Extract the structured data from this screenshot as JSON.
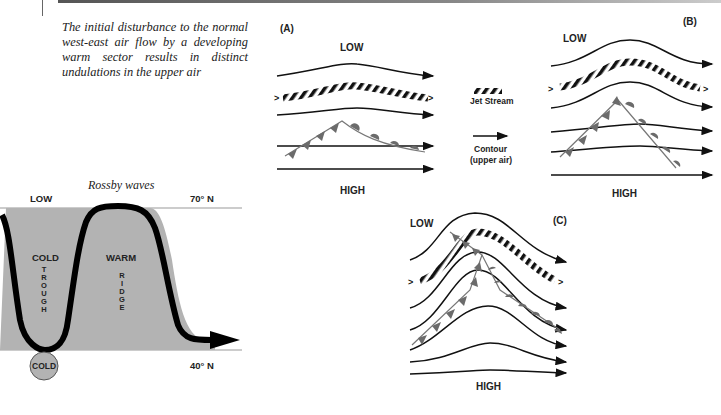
{
  "page": {
    "page_number": "90",
    "caption": "The initial disturbance to the normal west-east air flow by a developing warm sector results in distinct undulations in the upper air"
  },
  "rossby": {
    "title": "Rossby waves",
    "top_label": "LOW",
    "lat_top": "70° N",
    "lat_bottom": "40° N",
    "trough_temp": "COLD",
    "trough_letters": [
      "T",
      "R",
      "O",
      "U",
      "G",
      "H"
    ],
    "ridge_temp": "WARM",
    "ridge_letters": [
      "R",
      "I",
      "D",
      "G",
      "E"
    ],
    "cold_pool": "COLD",
    "colors": {
      "fill": "#b3b3b3",
      "curve": "#000000"
    }
  },
  "panels": {
    "a": {
      "tag": "(A)",
      "low": "LOW",
      "high": "HIGH"
    },
    "b": {
      "tag": "(B)",
      "low": "LOW",
      "high": "HIGH"
    },
    "c": {
      "tag": "(C)",
      "low": "LOW",
      "high": "HIGH"
    }
  },
  "legend": {
    "jet_stream": "Jet Stream",
    "contour_line1": "Contour",
    "contour_line2": "(upper air)"
  },
  "colors": {
    "front": "#6b6b6b",
    "line": "#111111"
  }
}
